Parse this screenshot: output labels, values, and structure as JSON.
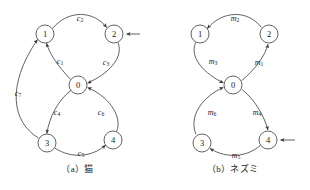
{
  "figure": {
    "panels": [
      {
        "id": "a",
        "caption": "（a）猫",
        "nodes": [
          {
            "id": "n0",
            "label": "0",
            "cx": 78,
            "cy": 85
          },
          {
            "id": "n1",
            "label": "1",
            "cx": 45,
            "cy": 34
          },
          {
            "id": "n2",
            "label": "2",
            "cx": 114,
            "cy": 34
          },
          {
            "id": "n3",
            "label": "3",
            "cx": 47,
            "cy": 143
          },
          {
            "id": "n4",
            "label": "4",
            "cx": 113,
            "cy": 140
          }
        ],
        "edges": [
          {
            "id": "c1",
            "name": "c",
            "sub": "1",
            "from": "n0",
            "to": "n1",
            "lx": 60,
            "ly": 61
          },
          {
            "id": "c2",
            "name": "c",
            "sub": "2",
            "from": "n1",
            "to": "n2",
            "lx": 80,
            "ly": 18
          },
          {
            "id": "c3",
            "name": "c",
            "sub": "3",
            "from": "n2",
            "to": "n0",
            "lx": 106,
            "ly": 62
          },
          {
            "id": "c4",
            "name": "c",
            "sub": "4",
            "from": "n0",
            "to": "n3",
            "lx": 57,
            "ly": 112
          },
          {
            "id": "c5",
            "name": "c",
            "sub": "5",
            "from": "n3",
            "to": "n4",
            "lx": 81,
            "ly": 153
          },
          {
            "id": "c6",
            "name": "c",
            "sub": "6",
            "from": "n4",
            "to": "n0",
            "lx": 101,
            "ly": 112
          },
          {
            "id": "c7",
            "name": "c",
            "sub": "7",
            "from": "n3",
            "to": "n1",
            "lx": 18,
            "ly": 93
          }
        ],
        "entry_arrow": {
          "target": "n2",
          "side": "right"
        }
      },
      {
        "id": "b",
        "caption": "（b）ネズミ",
        "nodes": [
          {
            "id": "n0",
            "label": "0",
            "cx": 78,
            "cy": 85
          },
          {
            "id": "n1",
            "label": "1",
            "cx": 45,
            "cy": 34
          },
          {
            "id": "n2",
            "label": "2",
            "cx": 114,
            "cy": 34
          },
          {
            "id": "n3",
            "label": "3",
            "cx": 47,
            "cy": 143
          },
          {
            "id": "n4",
            "label": "4",
            "cx": 113,
            "cy": 140
          }
        ],
        "edges": [
          {
            "id": "m1",
            "name": "m",
            "sub": "1",
            "from": "n0",
            "to": "n2",
            "lx": 104,
            "ly": 62
          },
          {
            "id": "m2",
            "name": "m",
            "sub": "2",
            "from": "n2",
            "to": "n1",
            "lx": 80,
            "ly": 18
          },
          {
            "id": "m3",
            "name": "m",
            "sub": "3",
            "from": "n1",
            "to": "n0",
            "lx": 58,
            "ly": 61
          },
          {
            "id": "m4",
            "name": "m",
            "sub": "4",
            "from": "n0",
            "to": "n4",
            "lx": 102,
            "ly": 112
          },
          {
            "id": "m5",
            "name": "m",
            "sub": "5",
            "from": "n4",
            "to": "n3",
            "lx": 81,
            "ly": 155
          },
          {
            "id": "m6",
            "name": "m",
            "sub": "6",
            "from": "n3",
            "to": "n0",
            "lx": 57,
            "ly": 112
          }
        ],
        "entry_arrow": {
          "target": "n4",
          "side": "right"
        }
      }
    ],
    "style": {
      "stroke_color": "#3b3b3b",
      "node_fill": "#ffffff",
      "text_color": "#1a1a1a",
      "background": "#ffffff",
      "node_radius": 9
    }
  }
}
